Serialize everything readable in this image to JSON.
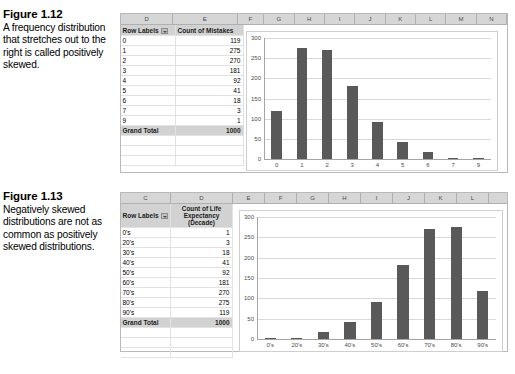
{
  "figures": [
    {
      "title": "Figure 1.12",
      "text": "A frequency distribution that stretches out to the right is called positively skewed.",
      "spreadsheet": {
        "column_headers": [
          "D",
          "E",
          "F",
          "G",
          "H",
          "I",
          "J",
          "K",
          "L",
          "M",
          "N"
        ],
        "row_label_header": "Row Labels",
        "value_header": "Count of Mistakes",
        "rows": [
          {
            "label": "0",
            "value": "119"
          },
          {
            "label": "1",
            "value": "275"
          },
          {
            "label": "2",
            "value": "270"
          },
          {
            "label": "3",
            "value": "181"
          },
          {
            "label": "4",
            "value": "92"
          },
          {
            "label": "5",
            "value": "41"
          },
          {
            "label": "6",
            "value": "18"
          },
          {
            "label": "7",
            "value": "3"
          },
          {
            "label": "9",
            "value": "1"
          }
        ],
        "total_label": "Grand Total",
        "total_value": "1000"
      },
      "chart_data": {
        "type": "bar",
        "title": "",
        "xlabel": "",
        "ylabel": "",
        "categories": [
          "0",
          "1",
          "2",
          "3",
          "4",
          "5",
          "6",
          "7",
          "9"
        ],
        "values": [
          119,
          275,
          270,
          181,
          92,
          41,
          18,
          3,
          1
        ],
        "ylim": [
          0,
          300
        ],
        "yticks": [
          "0",
          "50",
          "100",
          "150",
          "200",
          "250",
          "300"
        ],
        "grid": true,
        "legend": "none",
        "bar_color": "#595959"
      }
    },
    {
      "title": "Figure 1.13",
      "text": "Negatively skewed distributions are not as common as positively skewed distributions.",
      "spreadsheet": {
        "column_headers": [
          "C",
          "D",
          "E",
          "F",
          "G",
          "H",
          "I",
          "J",
          "K",
          "L"
        ],
        "row_label_header": "Row Labels",
        "value_header": "Count of Life Expectancy (Decade)",
        "rows": [
          {
            "label": "0's",
            "value": "1"
          },
          {
            "label": "20's",
            "value": "3"
          },
          {
            "label": "30's",
            "value": "18"
          },
          {
            "label": "40's",
            "value": "41"
          },
          {
            "label": "50's",
            "value": "92"
          },
          {
            "label": "60's",
            "value": "181"
          },
          {
            "label": "70's",
            "value": "270"
          },
          {
            "label": "80's",
            "value": "275"
          },
          {
            "label": "90's",
            "value": "119"
          }
        ],
        "total_label": "Grand Total",
        "total_value": "1000"
      },
      "chart_data": {
        "type": "bar",
        "title": "",
        "xlabel": "",
        "ylabel": "",
        "categories": [
          "0's",
          "20's",
          "30's",
          "40's",
          "50's",
          "60's",
          "70's",
          "80's",
          "90's"
        ],
        "values": [
          1,
          3,
          18,
          41,
          92,
          181,
          270,
          275,
          119
        ],
        "ylim": [
          0,
          300
        ],
        "yticks": [
          "0",
          "50",
          "100",
          "150",
          "200",
          "250",
          "300"
        ],
        "grid": true,
        "legend": "none",
        "bar_color": "#595959"
      }
    }
  ]
}
